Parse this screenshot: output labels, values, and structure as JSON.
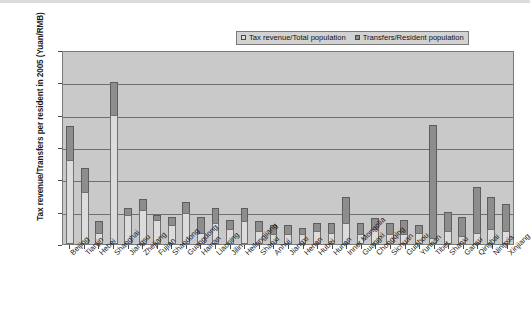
{
  "chart_data": {
    "type": "bar",
    "subtype": "stacked-column",
    "title": "",
    "xlabel": "",
    "ylabel": "Tax revenue/Transfers per resident in 2005 (Yuan/RMB)",
    "ylim": [
      0,
      12000
    ],
    "yticks": [
      12000,
      10000,
      8000,
      6000,
      4000,
      2000,
      0
    ],
    "ytick_labels": [
      "12000",
      "10000",
      "8000",
      "6000",
      "4000",
      "2000",
      "0"
    ],
    "grid": true,
    "legend_position": "top-right",
    "legend": [
      "Tax revenue/Total population",
      "Transfers/Resident population"
    ],
    "categories": [
      "Beijing",
      "Tianjin",
      "Hebei",
      "Shanghai",
      "Jiangsu",
      "Zhejiang",
      "Fujian",
      "Shandong",
      "Guangdong",
      "Hainan",
      "Liaoning",
      "Jilin",
      "Heilongjiang",
      "Shanxi",
      "Anhui",
      "Jiangxi",
      "Henan",
      "Hubei",
      "Hunan",
      "Inner Mongolia",
      "Guangxi",
      "Chongqing",
      "Sichuan",
      "Guizhou",
      "Yunnan",
      "Tibet",
      "Shanxi",
      "Gansu",
      "Qinghai",
      "Ningxia",
      "Xinjiang"
    ],
    "series": [
      {
        "name": "Tax revenue/Total population",
        "color": "#dcdcdc",
        "values": [
          5200,
          3200,
          700,
          8000,
          1800,
          2100,
          1500,
          1200,
          1900,
          700,
          1300,
          900,
          1400,
          800,
          600,
          600,
          600,
          800,
          700,
          1300,
          600,
          900,
          600,
          600,
          700,
          400,
          800,
          500,
          700,
          900,
          800
        ]
      },
      {
        "name": "Transfers/Resident population",
        "color": "#8d8d8d",
        "values": [
          2100,
          1500,
          700,
          2000,
          400,
          700,
          300,
          500,
          700,
          1000,
          900,
          600,
          800,
          600,
          600,
          600,
          400,
          500,
          600,
          1600,
          700,
          700,
          700,
          900,
          500,
          6950,
          1200,
          1200,
          2800,
          2000,
          1700
        ]
      }
    ],
    "totals": [
      7300,
      4700,
      1400,
      10000,
      2200,
      2800,
      1800,
      1700,
      2600,
      1700,
      2200,
      1500,
      2200,
      1400,
      1200,
      1200,
      1000,
      1300,
      1300,
      2900,
      1300,
      1600,
      1300,
      1500,
      1200,
      7350,
      2000,
      1700,
      3500,
      2900,
      2500
    ]
  }
}
